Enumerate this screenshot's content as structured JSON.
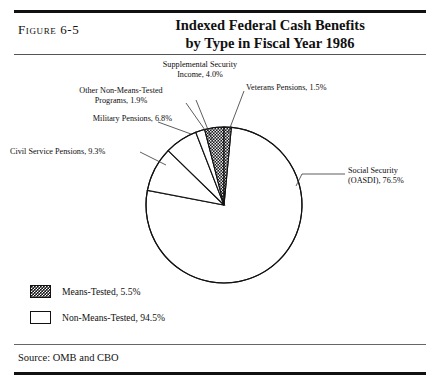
{
  "figure": {
    "number_label": "Figure 6-5",
    "title_line1": "Indexed Federal Cash Benefits",
    "title_line2": "by Type in Fiscal Year 1986",
    "source": "Source: OMB and CBO"
  },
  "callouts": {
    "ssi_line1": "Supplemental Security",
    "ssi_line2": "Income, 4.0%",
    "other_line1": "Other Non-Means-Tested",
    "other_line2": "Programs, 1.9%",
    "military": "Military Pensions, 6.8%",
    "civil": "Civil Service Pensions, 9.3%",
    "veterans": "Veterans Pensions, 1.5%",
    "social_line1": "Social Security",
    "social_line2": "(OASDI), 76.5%"
  },
  "legend": {
    "items": [
      {
        "label": "Means-Tested, 5.5%",
        "swatch": "dark-checkered",
        "value": 5.5
      },
      {
        "label": "Non-Means-Tested, 94.5%",
        "swatch": "white",
        "value": 94.5
      }
    ]
  },
  "chart_data": {
    "type": "pie",
    "title": "Indexed Federal Cash Benefits by Type in Fiscal Year 1986",
    "subtitle": "",
    "xlabel": "",
    "ylabel": "",
    "legend_position": "bottom-left",
    "grid": false,
    "units": "percent of total",
    "start_angle_deg": 0,
    "direction": "clockwise",
    "categories": [
      "Supplemental Security Income",
      "Veterans Pensions",
      "Social Security (OASDI)",
      "Civil Service Pensions",
      "Military Pensions",
      "Other Non-Means-Tested Programs"
    ],
    "values": [
      4.0,
      1.5,
      76.5,
      9.3,
      6.8,
      1.9
    ],
    "slices": [
      {
        "name": "Supplemental Security Income",
        "value": 4.0,
        "label": "Supplemental Security Income, 4.0%",
        "fill": "dark-checkered",
        "group": "Means-Tested"
      },
      {
        "name": "Veterans Pensions",
        "value": 1.5,
        "label": "Veterans Pensions, 1.5%",
        "fill": "dark-checkered",
        "group": "Means-Tested"
      },
      {
        "name": "Social Security (OASDI)",
        "value": 76.5,
        "label": "Social Security (OASDI), 76.5%",
        "fill": "white",
        "group": "Non-Means-Tested"
      },
      {
        "name": "Civil Service Pensions",
        "value": 9.3,
        "label": "Civil Service Pensions, 9.3%",
        "fill": "white",
        "group": "Non-Means-Tested"
      },
      {
        "name": "Military Pensions",
        "value": 6.8,
        "label": "Military Pensions, 6.8%",
        "fill": "white",
        "group": "Non-Means-Tested"
      },
      {
        "name": "Other Non-Means-Tested Programs",
        "value": 1.9,
        "label": "Other Non-Means-Tested Programs, 1.9%",
        "fill": "white",
        "group": "Non-Means-Tested"
      }
    ],
    "groups": [
      {
        "name": "Means-Tested",
        "value": 5.5
      },
      {
        "name": "Non-Means-Tested",
        "value": 94.5
      }
    ],
    "total": 100.0,
    "colors": {
      "dark": "#15151a",
      "light": "#ffffff",
      "outline": "#111111"
    }
  }
}
